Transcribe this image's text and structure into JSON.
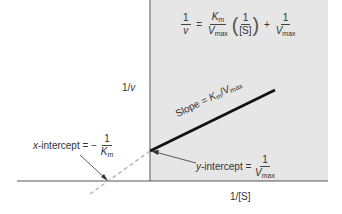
{
  "diagram": {
    "colors": {
      "panel": "#e6e6e6",
      "axis": "#555555",
      "line": "#111111",
      "dashed": "#aaaaaa",
      "background": "#ffffff"
    },
    "equation": {
      "lhs_num": "1",
      "lhs_den": "v",
      "equals": "=",
      "term1_num": "K",
      "term1_num_sub": "m",
      "term1_den": "V",
      "term1_den_sub": "max",
      "open_paren": "(",
      "paren_num": "1",
      "paren_den": "[S]",
      "close_paren": ")",
      "plus": "+",
      "term2_num": "1",
      "term2_den": "V",
      "term2_den_sub": "max"
    },
    "y_axis_label": "1/v",
    "y_axis_label_main": "1/",
    "y_axis_label_var": "v",
    "x_axis_label": "1/[S]",
    "slope_label": {
      "prefix": "Slope = ",
      "k": "K",
      "k_sub": "m",
      "slash": "/",
      "v": "V",
      "v_sub": "max"
    },
    "x_intercept": {
      "var": "x",
      "text": "-intercept = −",
      "num": "1",
      "den": "K",
      "den_sub": "m"
    },
    "y_intercept": {
      "var": "y",
      "text": "-intercept = ",
      "num": "1",
      "den": "V",
      "den_sub": "max"
    }
  }
}
